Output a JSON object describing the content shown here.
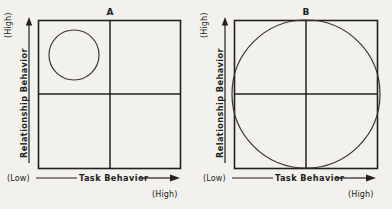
{
  "figure": {
    "background_color": "#f3f1ed",
    "ink_color": "#231f20",
    "circle_color": "#3a3535",
    "panels": [
      {
        "id": "A",
        "label": "A",
        "x_axis": {
          "name": "Task Behavior",
          "low_label": "(Low)",
          "high_label": "(High)"
        },
        "y_axis": {
          "name": "Relationship Behavior",
          "low_label": "(Low)",
          "high_label": "(High)"
        },
        "circle": {
          "description": "small-circle-upper-left-quadrant",
          "center_x": 74,
          "center_y": 55,
          "radius": 25
        }
      },
      {
        "id": "B",
        "label": "B",
        "x_axis": {
          "name": "Task Behavior",
          "low_label": "(Low)",
          "high_label": "(High)"
        },
        "y_axis": {
          "name": "Relationship Behavior",
          "low_label": "(Low)",
          "high_label": "(High)"
        },
        "circle": {
          "description": "large-circle-spanning-all-quadrants",
          "center_x": 306,
          "center_y": 94,
          "radius": 74
        }
      }
    ]
  },
  "chart_data": {
    "type": "scatter",
    "title": "",
    "xlabel": "Task Behavior",
    "ylabel": "Relationship Behavior",
    "xlim": [
      0,
      100
    ],
    "ylim": [
      0,
      100
    ],
    "grid": false,
    "legend": null,
    "xtick_labels": [
      "(Low)",
      "(High)"
    ],
    "ytick_labels": [
      "(Low)",
      "(High)"
    ],
    "panels": [
      {
        "name": "A",
        "quadrant_divider_x": 50,
        "quadrant_divider_y": 50,
        "circle": {
          "cx": 25,
          "cy": 75,
          "r": 17.5
        }
      },
      {
        "name": "B",
        "quadrant_divider_x": 50,
        "quadrant_divider_y": 50,
        "circle": {
          "cx": 50,
          "cy": 50,
          "r": 52
        }
      }
    ]
  }
}
